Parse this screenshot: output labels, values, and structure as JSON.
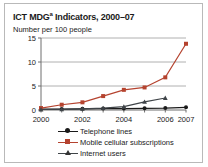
{
  "title": "ICT MDG",
  "title_sup": "a",
  "title_rest": " Indicators, 2000–07",
  "subtitle": "Number per 100 people",
  "colors": {
    "telephone": "#1a1a1a",
    "mobile": "#b5432f",
    "internet": "#3f4448",
    "grid": "#b0b0b0",
    "axis": "#6e6e6e",
    "frame": "#b9b9b9",
    "text": "#1a1a1a"
  },
  "legend": {
    "items": [
      {
        "label": "Telephone lines",
        "marker": "circle-marker",
        "color": "#1a1a1a"
      },
      {
        "label": "Mobile cellular subscriptions",
        "marker": "square-marker",
        "color": "#b5432f"
      },
      {
        "label": "Internet users",
        "marker": "triangle-marker",
        "color": "#3f4448"
      }
    ]
  },
  "chart_data": {
    "type": "line",
    "title": "ICT MDGa Indicators, 2000–07",
    "subtitle": "Number per 100 people",
    "xlabel": "",
    "ylabel": "Number per 100 people",
    "x": [
      2000,
      2001,
      2002,
      2003,
      2004,
      2005,
      2006,
      2007
    ],
    "xtick_labels": [
      "2000",
      "2002",
      "2004",
      "2006",
      "2007"
    ],
    "xticks": [
      2000,
      2002,
      2004,
      2006,
      2007
    ],
    "ytick_labels": [
      "0",
      "5",
      "10",
      "15"
    ],
    "yticks": [
      0,
      5,
      10,
      15
    ],
    "xlim": [
      2000,
      2007
    ],
    "ylim": [
      0,
      15
    ],
    "grid": true,
    "legend_position": "below",
    "series": [
      {
        "name": "Telephone lines",
        "color": "#1a1a1a",
        "marker": "circle",
        "values": [
          0.2,
          0.2,
          0.25,
          0.3,
          0.3,
          0.35,
          0.4,
          0.55
        ]
      },
      {
        "name": "Mobile cellular subscriptions",
        "color": "#b5432f",
        "marker": "square",
        "values": [
          0.4,
          1.1,
          1.6,
          2.9,
          4.2,
          4.7,
          6.8,
          13.8
        ]
      },
      {
        "name": "Internet users",
        "color": "#3f4448",
        "marker": "triangle",
        "values": [
          0.1,
          0.15,
          0.25,
          0.4,
          0.7,
          1.7,
          2.5,
          null
        ]
      }
    ]
  }
}
